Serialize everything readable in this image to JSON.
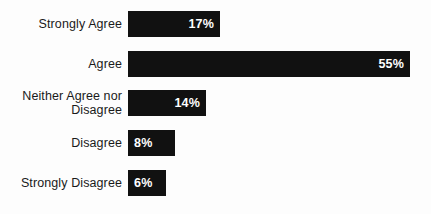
{
  "chart_data": {
    "type": "bar",
    "orientation": "horizontal",
    "title": "",
    "subtitle": "",
    "xlabel": "",
    "ylabel": "",
    "xlim": [
      0,
      55
    ],
    "grid": false,
    "legend": null,
    "value_suffix": "%",
    "categories": [
      "Strongly Agree",
      "Agree",
      "Neither Agree nor\nDisagree",
      "Disagree",
      "Strongly Disagree"
    ],
    "values": [
      17,
      55,
      14,
      8,
      6
    ],
    "value_labels": [
      "17%",
      "55%",
      "14%",
      "8%",
      "6%"
    ],
    "colors": {
      "bar": "#111111",
      "bar_value_text": "#ffffff",
      "category_label_text": "#1a1a1a",
      "background": "#fdfdfd"
    }
  },
  "rows": [
    {
      "label": "Strongly Agree",
      "value_label": "17%",
      "bar_width_px": 92,
      "top_px": 4,
      "align": "align-right"
    },
    {
      "label": "Agree",
      "value_label": "55%",
      "bar_width_px": 282,
      "top_px": 44,
      "align": "align-right"
    },
    {
      "label": "Neither Agree nor\nDisagree",
      "value_label": "14%",
      "bar_width_px": 78,
      "top_px": 83,
      "align": "align-right"
    },
    {
      "label": "Disagree",
      "value_label": "8%",
      "bar_width_px": 47,
      "top_px": 123,
      "align": "align-left"
    },
    {
      "label": "Strongly Disagree",
      "value_label": "6%",
      "bar_width_px": 38,
      "top_px": 163,
      "align": "align-left"
    }
  ]
}
